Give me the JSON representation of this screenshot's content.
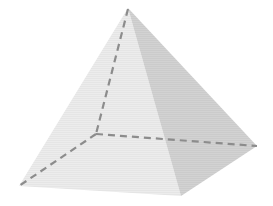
{
  "diagram": {
    "type": "square-pyramid",
    "vertices": {
      "apex": [
        128,
        8
      ],
      "back_hidden": [
        96,
        134
      ],
      "left_front": [
        19,
        186
      ],
      "bottom_front": [
        181,
        196
      ],
      "right": [
        257,
        146
      ]
    },
    "colors": {
      "background": "#ffffff",
      "left_face": "#ececec",
      "right_face": "#d4d4d4",
      "hidden_edge": "#8c8c8c"
    },
    "hidden_edges": [
      [
        "apex",
        "back_hidden"
      ],
      [
        "back_hidden",
        "left_front"
      ],
      [
        "back_hidden",
        "right"
      ]
    ]
  }
}
